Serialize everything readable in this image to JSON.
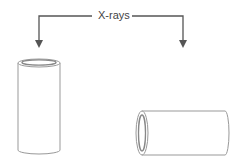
{
  "diagram": {
    "label": "X-rays",
    "objects": [
      {
        "name": "vertical-cylinder",
        "orientation": "upright"
      },
      {
        "name": "horizontal-cylinder",
        "orientation": "lying"
      }
    ],
    "colors": {
      "line": "#555555",
      "outline": "#999999"
    }
  }
}
